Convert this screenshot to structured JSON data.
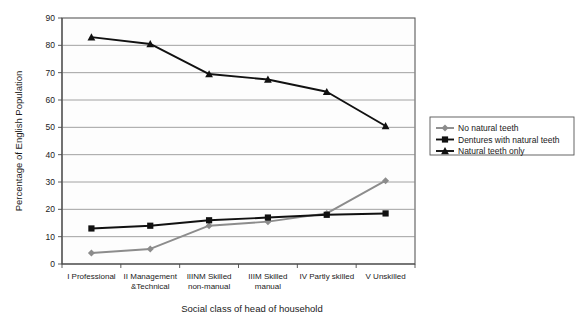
{
  "chart_data": {
    "type": "line",
    "title": "",
    "xlabel": "Social class of head of household",
    "ylabel": "Percentage of English Population",
    "ylim": [
      0,
      90
    ],
    "ytick_step": 10,
    "yticks": [
      "0",
      "10",
      "20",
      "30",
      "40",
      "50",
      "60",
      "70",
      "80",
      "90"
    ],
    "grid": true,
    "legend_position": "right",
    "categories": [
      "I Professional",
      "II Management &Technical",
      "IIINM Skilled non-manual",
      "IIIM Skilled manual",
      "IV Partly skilled",
      "V Unskilled"
    ],
    "category_lines": [
      [
        "I Professional"
      ],
      [
        "II Management",
        "&Technical"
      ],
      [
        "IIINM Skilled",
        "non-manual"
      ],
      [
        "IIIM Skilled",
        "manual"
      ],
      [
        "IV Partly skilled"
      ],
      [
        "V Unskilled"
      ]
    ],
    "series": [
      {
        "name": "No natural teeth",
        "marker": "diamond",
        "color": "#8c8c8c",
        "values": [
          4,
          5.5,
          14,
          15.5,
          18.5,
          30.5
        ]
      },
      {
        "name": "Dentures with natural teeth",
        "marker": "square",
        "color": "#111111",
        "values": [
          13,
          14,
          16,
          17,
          18,
          18.5
        ]
      },
      {
        "name": "Natural teeth only",
        "marker": "triangle",
        "color": "#111111",
        "values": [
          83,
          80.5,
          69.5,
          67.5,
          63,
          50.5
        ]
      }
    ]
  },
  "legend": {
    "items": [
      {
        "label": "No natural teeth"
      },
      {
        "label": "Dentures with natural teeth"
      },
      {
        "label": "Natural teeth only"
      }
    ]
  },
  "axes": {
    "y_title": "Percentage of English Population",
    "x_title": "Social class of head of household"
  }
}
